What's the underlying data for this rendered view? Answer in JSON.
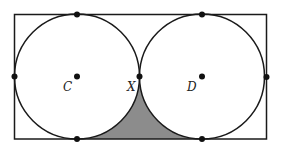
{
  "diagram": {
    "labels": {
      "center_left": "C",
      "center_right": "D",
      "tangent_point": "X"
    },
    "colors": {
      "stroke": "#1a1a1a",
      "shaded": "#8c8c8c",
      "background": "#ffffff"
    }
  }
}
